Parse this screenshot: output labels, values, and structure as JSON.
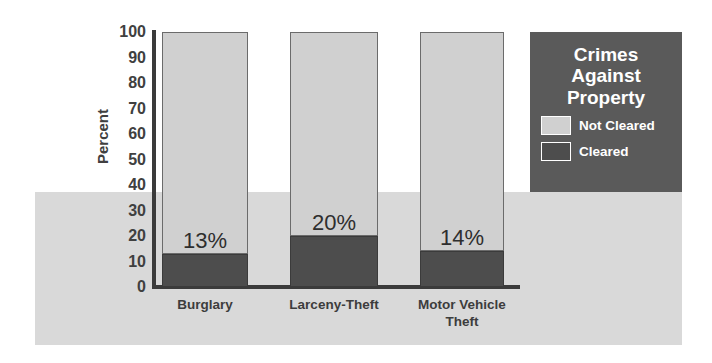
{
  "chart_data": {
    "type": "bar",
    "subtype": "stacked-bar-100-percent",
    "title": "Crimes Against Property",
    "xlabel": "",
    "ylabel": "Percent",
    "ylim": [
      0,
      100
    ],
    "yticks": [
      "100",
      "90",
      "80",
      "70",
      "60",
      "50",
      "40",
      "30",
      "20",
      "10",
      "0"
    ],
    "grid": false,
    "legend_position": "right",
    "categories": [
      "Burglary",
      "Larceny-Theft",
      "Motor Vehicle Theft"
    ],
    "series": [
      {
        "name": "Not Cleared",
        "color": "#d0d0d0",
        "values": [
          87,
          80,
          86
        ]
      },
      {
        "name": "Cleared",
        "color": "#4d4d4d",
        "values": [
          13,
          20,
          14
        ]
      }
    ],
    "data_labels": [
      "13%",
      "20%",
      "14%"
    ],
    "annotations": []
  },
  "axis": {
    "y_title": "Percent",
    "ticks": [
      {
        "label": "100",
        "value": 100
      },
      {
        "label": "90",
        "value": 90
      },
      {
        "label": "80",
        "value": 80
      },
      {
        "label": "70",
        "value": 70
      },
      {
        "label": "60",
        "value": 60
      },
      {
        "label": "50",
        "value": 50
      },
      {
        "label": "40",
        "value": 40
      },
      {
        "label": "30",
        "value": 30
      },
      {
        "label": "20",
        "value": 20
      },
      {
        "label": "10",
        "value": 10
      },
      {
        "label": "0",
        "value": 0
      }
    ]
  },
  "legend": {
    "title_lines": [
      "Crimes",
      "Against",
      "Property"
    ],
    "items": [
      {
        "label": "Not Cleared",
        "color": "#d0d0d0"
      },
      {
        "label": "Cleared",
        "color": "#4d4d4d"
      }
    ],
    "background_color": "#5a5a5a",
    "text_color": "#ffffff"
  },
  "categories": [
    {
      "label_line1": "Burglary",
      "label_line2": ""
    },
    {
      "label_line1": "Larceny-Theft",
      "label_line2": ""
    },
    {
      "label_line1": "Motor Vehicle",
      "label_line2": "Theft"
    }
  ],
  "theme": {
    "background": "#ffffff",
    "band_color": "#d9d9d9",
    "axis_color": "#3b3b3b",
    "tick_text_color": "#404040",
    "value_text_color": "#2e2e2e"
  }
}
